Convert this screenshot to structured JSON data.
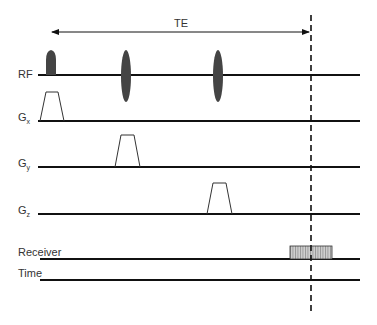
{
  "diagram": {
    "type": "pulse-sequence-timing",
    "interval_label": "TE",
    "channels": [
      {
        "id": "rf",
        "label": "RF",
        "subscript": ""
      },
      {
        "id": "gx",
        "label": "G",
        "subscript": "x"
      },
      {
        "id": "gy",
        "label": "G",
        "subscript": "y"
      },
      {
        "id": "gz",
        "label": "G",
        "subscript": "z"
      },
      {
        "id": "receiver",
        "label": "Receiver",
        "subscript": ""
      },
      {
        "id": "time",
        "label": "Time",
        "subscript": ""
      }
    ],
    "colors": {
      "line": "#111111",
      "pulse_fill": "#444444",
      "receiver_fill": "#bbbbbb",
      "text": "#333333"
    }
  }
}
